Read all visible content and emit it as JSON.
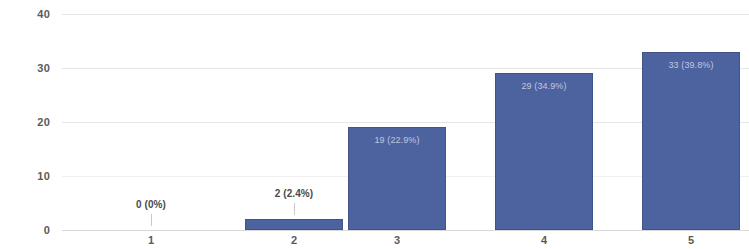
{
  "chart_data": {
    "type": "bar",
    "title": "",
    "subtitle": "",
    "xlabel": "",
    "ylabel": "",
    "categories": [
      "1",
      "2",
      "3",
      "4",
      "5"
    ],
    "values": [
      0,
      2,
      19,
      29,
      33
    ],
    "data_labels": [
      "0 (0%)",
      "2 (2.4%)",
      "19 (22.9%)",
      "29 (34.9%)",
      "33 (39.8%)"
    ],
    "percentages": [
      "0%",
      "2.4%",
      "22.9%",
      "34.9%",
      "39.8%"
    ],
    "total": 83,
    "ylim": [
      0,
      40
    ],
    "yticks": [
      "0",
      "10",
      "20",
      "30",
      "40"
    ],
    "ytick_values": [
      0,
      10,
      20,
      30,
      40
    ],
    "grid": true,
    "legend": "none",
    "series": [
      {
        "name": "responses",
        "values": [
          0,
          2,
          19,
          29,
          33
        ]
      }
    ],
    "colors": {
      "bar": "#4d63a0",
      "grid": "#e6e6e6",
      "axis_text": "#5a5a5a",
      "inside_label": "#d9ddee",
      "outside_label": "#4a4a4a",
      "background": "#ffffff"
    }
  }
}
